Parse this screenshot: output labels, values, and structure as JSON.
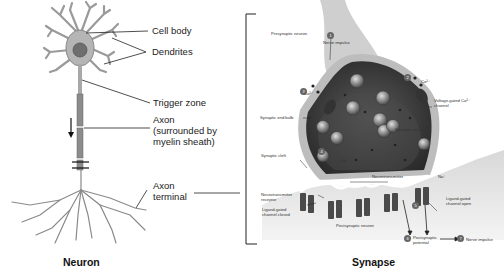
{
  "neuron": {
    "title": "Neuron",
    "labels": {
      "cell_body": "Cell body",
      "dendrites": "Dendrites",
      "trigger_zone": "Trigger zone",
      "axon_line1": "Axon",
      "axon_line2": "(surrounded by",
      "axon_line3": "myelin sheath)",
      "axon_terminal_line1": "Axon",
      "axon_terminal_line2": "terminal"
    }
  },
  "synapse": {
    "title": "Synapse",
    "labels": {
      "presynaptic_neuron": "Presynaptic neuron",
      "nerve_impulse_top": "Nerve impulse",
      "ca_top": "Ca²⁺",
      "voltage_gated_line1": "Voltage-gated Ca²⁺",
      "voltage_gated_line2": "channel",
      "synaptic_end_bulb": "Synaptic end bulb",
      "synaptic_vesicles": "Synaptic vesicles",
      "synaptic_cleft": "Synaptic cleft",
      "ca_inner": "Ca²⁺",
      "neurotransmitter": "Neurotransmitter",
      "na": "Na⁺",
      "nt_receptor_line1": "Neurotransmitter",
      "nt_receptor_line2": "receptor",
      "ligand_closed_line1": "Ligand-gated",
      "ligand_closed_line2": "channel closed",
      "ligand_open_line1": "Ligand-gated",
      "ligand_open_line2": "channel open",
      "postsynaptic_neuron": "Postsynaptic neuron",
      "postsynaptic_potential_line1": "Postsynaptic",
      "postsynaptic_potential_line2": "potential",
      "nerve_impulse_bottom": "Nerve impulse"
    },
    "steps": [
      "1",
      "2",
      "3",
      "4",
      "5",
      "6",
      "7"
    ]
  }
}
